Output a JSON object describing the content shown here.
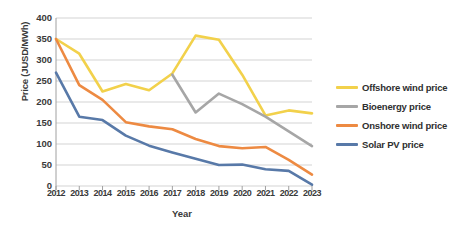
{
  "chart_data": {
    "type": "line",
    "title": "",
    "xlabel": "Year",
    "ylabel": "Price (JUSD/MWh)",
    "categories": [
      "2012",
      "2013",
      "2014",
      "2015",
      "2016",
      "2017",
      "2018",
      "2019",
      "2020",
      "2021",
      "2022",
      "2023"
    ],
    "x": [
      2012,
      2013,
      2014,
      2015,
      2016,
      2017,
      2018,
      2019,
      2020,
      2021,
      2022,
      2023
    ],
    "ylim": [
      0,
      400
    ],
    "yticks": [
      0,
      50,
      100,
      150,
      200,
      250,
      300,
      350,
      400
    ],
    "grid": "horizontal",
    "legend_position": "right",
    "series": [
      {
        "name": "Offshore wind price",
        "color": "#F2D14B",
        "values": [
          350,
          315,
          225,
          243,
          228,
          268,
          358,
          348,
          265,
          168,
          180,
          173
        ]
      },
      {
        "name": "Bioenergy price",
        "color": "#A6A6A6",
        "values": [
          null,
          null,
          null,
          null,
          null,
          265,
          175,
          220,
          195,
          165,
          130,
          95
        ]
      },
      {
        "name": "Onshore wind price",
        "color": "#ED8A42",
        "values": [
          350,
          240,
          205,
          152,
          142,
          135,
          112,
          95,
          90,
          93,
          62,
          27
        ]
      },
      {
        "name": "Solar PV price",
        "color": "#5879A8",
        "values": [
          270,
          165,
          157,
          120,
          96,
          80,
          65,
          50,
          51,
          40,
          36,
          3
        ]
      }
    ]
  },
  "axes": {
    "y_title": "Price (JUSD/MWh)",
    "x_title": "Year",
    "y_tick_labels": [
      "400",
      "350",
      "300",
      "250",
      "200",
      "150",
      "100",
      "50",
      "0"
    ],
    "x_tick_labels": [
      "2012",
      "2013",
      "2014",
      "2015",
      "2016",
      "2017",
      "2018",
      "2019",
      "2020",
      "2021",
      "2022",
      "2023"
    ]
  },
  "legend": {
    "items": [
      {
        "label": "Offshore wind price",
        "color": "#F2D14B"
      },
      {
        "label": "Bioenergy price",
        "color": "#A6A6A6"
      },
      {
        "label": "Onshore wind price",
        "color": "#ED8A42"
      },
      {
        "label": "Solar PV price",
        "color": "#5879A8"
      }
    ]
  },
  "colors": {
    "offshore_wind": "#F2D14B",
    "bioenergy": "#A6A6A6",
    "onshore_wind": "#ED8A42",
    "solar_pv": "#5879A8",
    "gridline": "#C8C8C8",
    "axis": "#A0A0A0",
    "text": "#3A3A3A",
    "background": "#FFFFFF"
  }
}
